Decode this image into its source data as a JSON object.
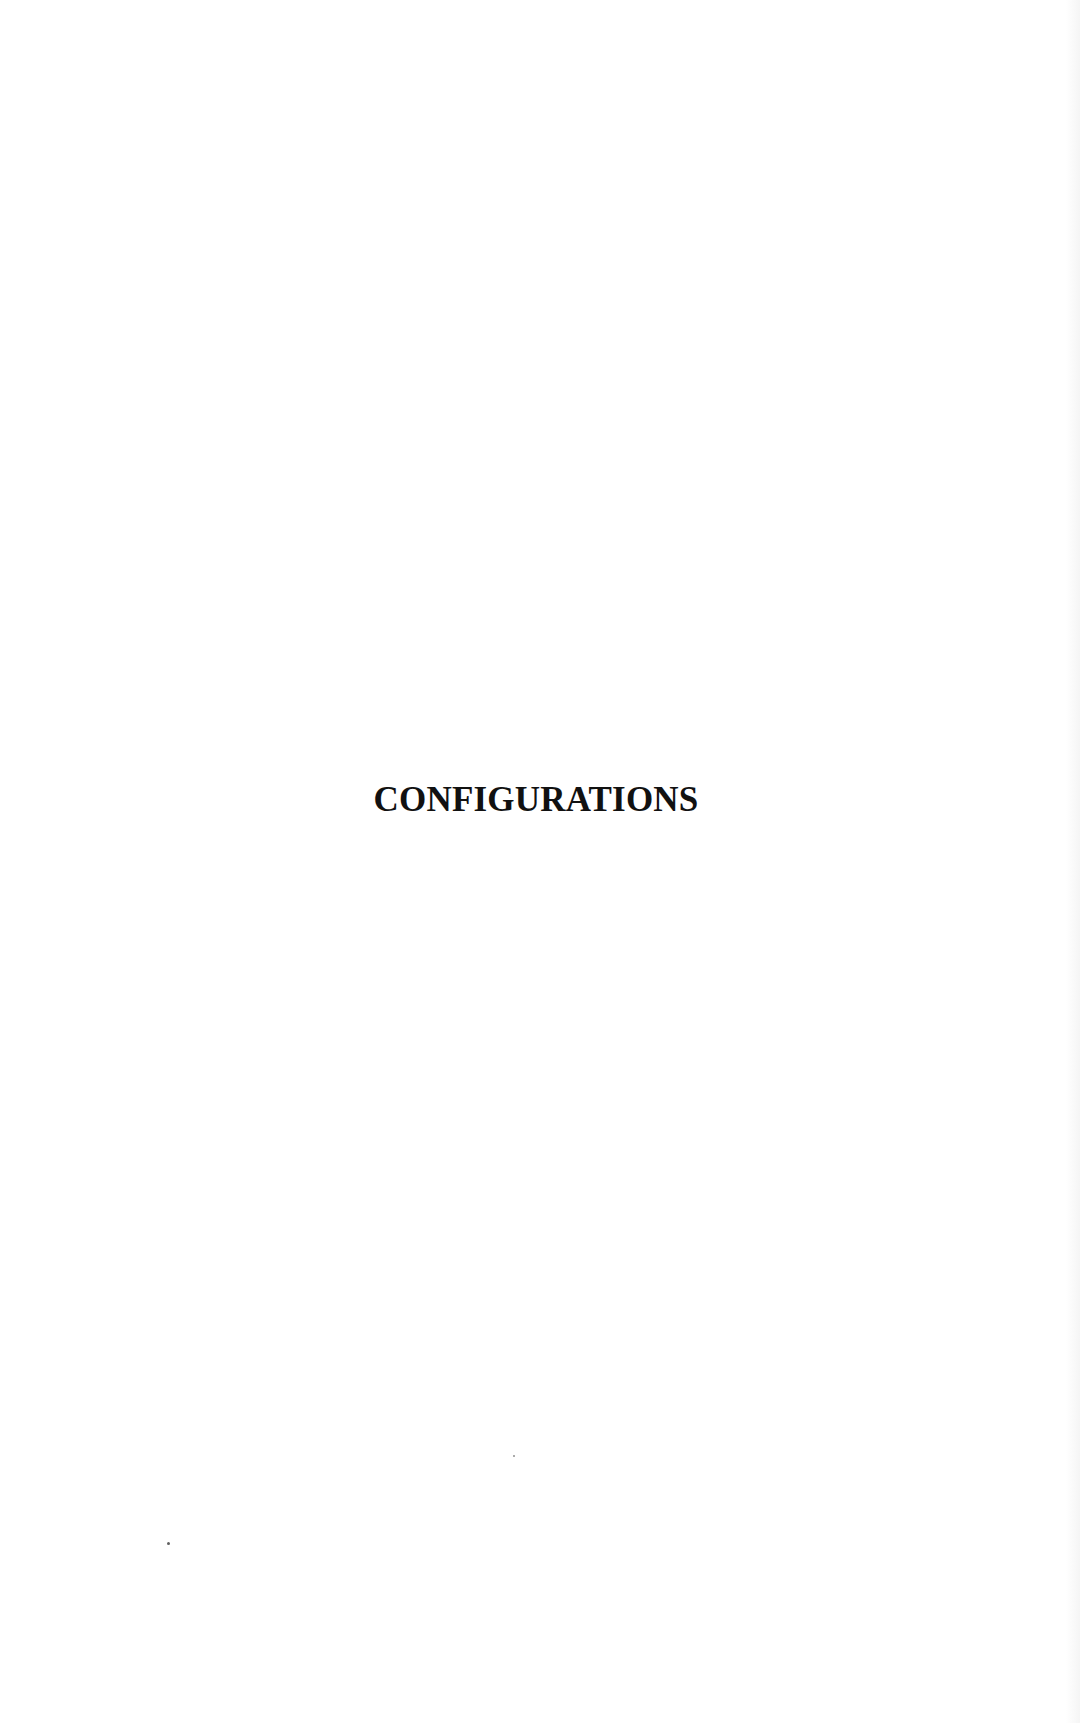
{
  "page": {
    "section_title": "CONFIGURATIONS"
  }
}
